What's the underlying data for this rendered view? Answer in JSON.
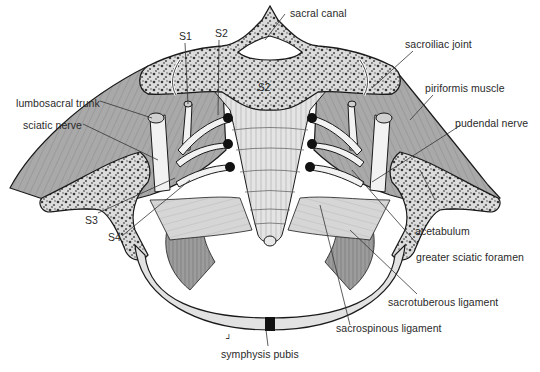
{
  "figure": {
    "labels": {
      "sacral_canal": "sacral canal",
      "sacroiliac_joint": "sacroiliac joint",
      "piriformis_muscle": "piriformis muscle",
      "pudendal_nerve": "pudendal nerve",
      "acetabulum": "acetabulum",
      "greater_sciatic_foramen": "greater sciatic foramen",
      "sacrotuberous_ligament": "sacrotuberous ligament",
      "sacrospinous_ligament": "sacrospinous ligament",
      "symphysis_pubis": "symphysis pubis",
      "lumbosacral_trunk": "lumbosacral trunk",
      "sciatic_nerve": "sciatic nerve",
      "s1": "S1",
      "s2": "S2",
      "s3": "S3",
      "s4": "S4",
      "s2_body": "S2"
    },
    "colors": {
      "bone_fill": "#e6e6e6",
      "cancellous": "#9a9a9a",
      "muscle_fill": "#a8a8a8",
      "muscle_dark": "#8c8c8c",
      "ligament_fill": "#d8d8d8",
      "outline": "#1a1a1a",
      "leader_line": "#333333",
      "text": "#2a2a2a"
    }
  }
}
